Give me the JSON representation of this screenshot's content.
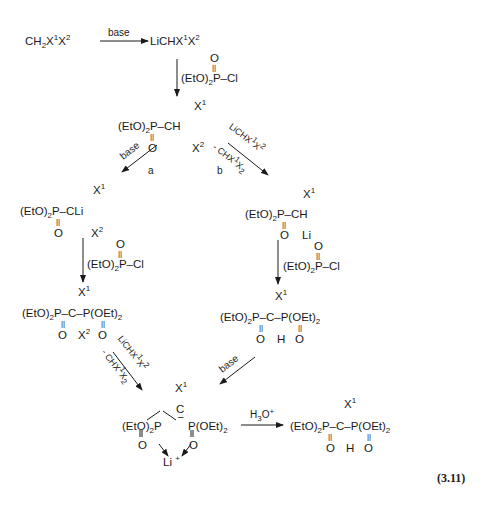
{
  "scheme": {
    "equation_number": "(3.11)",
    "step1": {
      "reactant": "CH2X1X2",
      "reagent": "base",
      "product": "LiCHX1X2"
    },
    "step2": {
      "reagent": "(EtO)2P(O)-Cl",
      "product": "(EtO)2P(O)-CH(X1)(X2)"
    },
    "path_a": {
      "label": "a",
      "reagent": "base",
      "intermediate": "(EtO)2P(O)-CLi(X1)(X2)",
      "reagent2": "(EtO)2P(O)-Cl",
      "product": "(EtO)2P(O)-C(X1)(X2)-P(O)(OEt)2",
      "reagent3_top": "LiCHX1X2",
      "reagent3_bottom": "- CHX1X2 2"
    },
    "path_b": {
      "label": "b",
      "reagent_top": "LiCHX1X2",
      "reagent_bottom": "- CHX1X2 2",
      "intermediate": "(EtO)2P(O)-CH(X1)Li",
      "reagent2": "(EtO)2P(O)-Cl",
      "product": "(EtO)2P(O)-CH(X1)-P(O)(OEt)2",
      "reagent3": "base"
    },
    "chelate": "[(EtO)2P(O)]2C(-)X1 Li+",
    "final_reagent": "H3O+",
    "final_product": "(EtO)2P(O)-CH(X1)-P(O)(OEt)2"
  },
  "labels": {
    "base": "base",
    "a": "a",
    "b": "b",
    "h3o": "H",
    "h3o_sub": "3",
    "h3o_rest": "O",
    "plus": "+",
    "li": "Li",
    "eq": "(3.11)"
  }
}
